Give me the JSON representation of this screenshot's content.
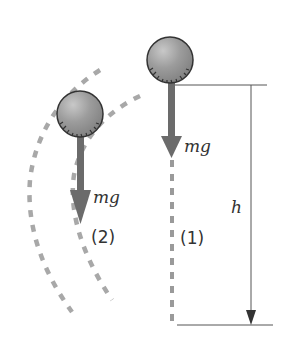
{
  "diagram": {
    "title": "",
    "labels": {
      "force_1": "mg",
      "force_2": "mg",
      "path_1": "(1)",
      "path_2": "(2)",
      "height": "h"
    },
    "colors": {
      "ball": "#9a9a9a",
      "arrow": "#6b6b6b",
      "dashed_path": "#a8a8a8",
      "lines": "#555555"
    },
    "elements": [
      {
        "name": "ball-1",
        "description": "ball at top, falling straight down along path (1)"
      },
      {
        "name": "ball-2",
        "description": "ball on curved path (2) between two dashed curves"
      },
      {
        "name": "height-dimension",
        "description": "vertical arrow marking height h"
      }
    ]
  }
}
